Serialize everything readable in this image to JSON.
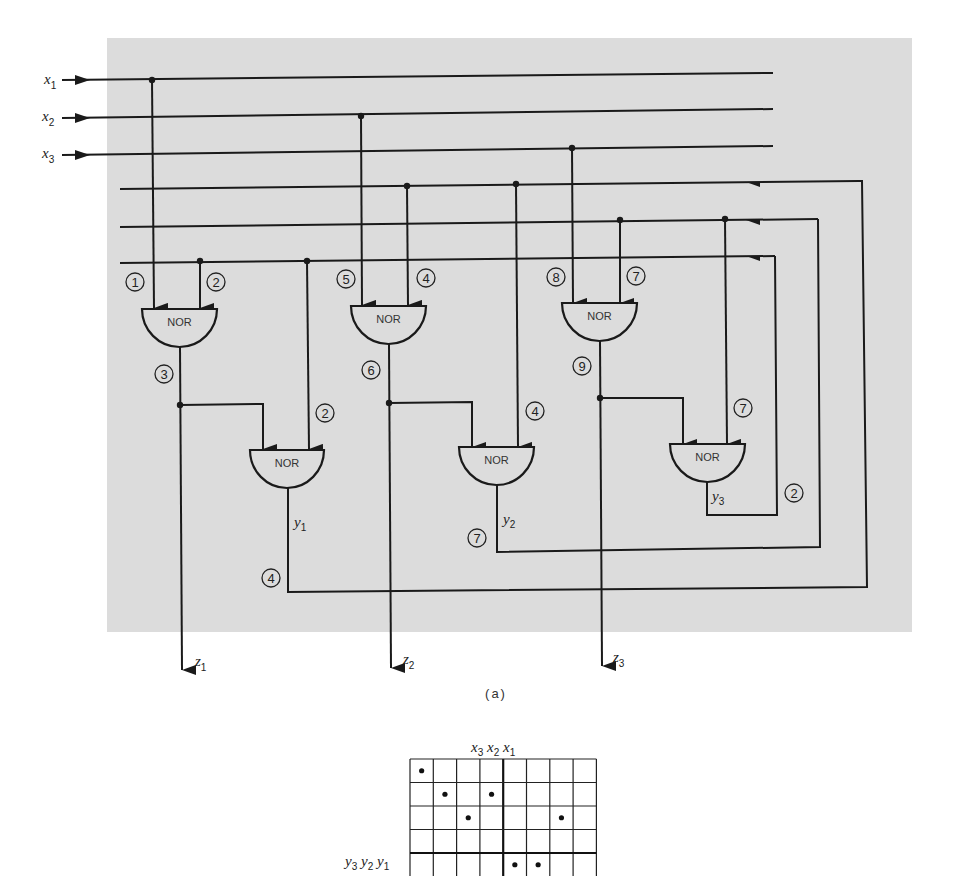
{
  "figure": {
    "caption": "(a)",
    "panel_color": "#dcdcdc",
    "line_color": "#1a1a1a"
  },
  "inputs": [
    {
      "name": "x",
      "sub": "1"
    },
    {
      "name": "x",
      "sub": "2"
    },
    {
      "name": "x",
      "sub": "3"
    }
  ],
  "outputs": [
    {
      "name": "z",
      "sub": "1"
    },
    {
      "name": "z",
      "sub": "2"
    },
    {
      "name": "z",
      "sub": "3"
    }
  ],
  "state_vars": [
    {
      "name": "y",
      "sub": "1"
    },
    {
      "name": "y",
      "sub": "2"
    },
    {
      "name": "y",
      "sub": "3"
    }
  ],
  "gates": [
    {
      "id": "g1",
      "label": "NOR"
    },
    {
      "id": "g2",
      "label": "NOR"
    },
    {
      "id": "g3",
      "label": "NOR"
    },
    {
      "id": "g4",
      "label": "NOR"
    },
    {
      "id": "g5",
      "label": "NOR"
    },
    {
      "id": "g6",
      "label": "NOR"
    }
  ],
  "wire_labels": {
    "g1_in_a": "1",
    "g1_in_b": "2",
    "g1_out": "3",
    "g2_in_b": "2",
    "y1_fb": "4",
    "g3_in_a": "5",
    "g3_in_b": "4",
    "g3_out": "6",
    "g4_in_b": "4",
    "y2_fb": "7",
    "g5_in_a": "8",
    "g5_in_b": "7",
    "g5_out": "9",
    "g6_in_b": "7",
    "y3_fb": "2"
  },
  "kmap": {
    "col_label": "x3 x2 x1",
    "row_label": "y3 y2 y1",
    "col_vars": [
      {
        "name": "x",
        "sub": "3"
      },
      {
        "name": "x",
        "sub": "2"
      },
      {
        "name": "x",
        "sub": "1"
      }
    ],
    "row_vars": [
      {
        "name": "y",
        "sub": "3"
      },
      {
        "name": "y",
        "sub": "2"
      },
      {
        "name": "y",
        "sub": "1"
      }
    ],
    "cols": 8,
    "visible_rows": 5,
    "dots": [
      {
        "row": 0,
        "col": 0
      },
      {
        "row": 1,
        "col": 1
      },
      {
        "row": 1,
        "col": 3
      },
      {
        "row": 2,
        "col": 2
      },
      {
        "row": 2,
        "col": 6
      },
      {
        "row": 4,
        "col": 4
      },
      {
        "row": 4,
        "col": 5
      }
    ]
  }
}
